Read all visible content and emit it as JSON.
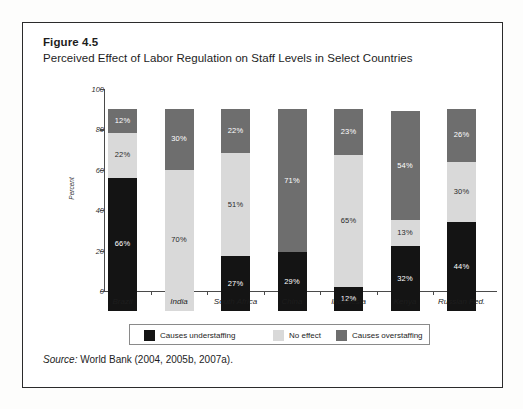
{
  "figure": {
    "number": "Figure 4.5",
    "subtitle": "Perceived Effect of Labor Regulation on Staff Levels in Select Countries",
    "source_prefix": "Source:",
    "source_text": " World Bank (2004, 2005b, 2007a)."
  },
  "colors": {
    "understaffing": "#141414",
    "no_effect": "#d9d9d9",
    "overstaffing": "#6e6e6e",
    "axis": "#4a4a4a",
    "frame": "#2b2b2b",
    "background": "#ffffff"
  },
  "legend": {
    "items": [
      {
        "label": "Causes understaffing",
        "color": "#141414"
      },
      {
        "label": "No effect",
        "color": "#d9d9d9"
      },
      {
        "label": "Causes overstaffing",
        "color": "#6e6e6e"
      }
    ]
  },
  "chart_data": {
    "type": "bar",
    "subtype": "stacked-column-100",
    "title": "Perceived Effect of Labor Regulation on Staff Levels in Select Countries",
    "xlabel": "",
    "ylabel": "Percent",
    "ylim": [
      0,
      100
    ],
    "yticks": [
      0,
      20,
      40,
      60,
      80,
      100
    ],
    "ytick_labels": [
      "0",
      "20",
      "40",
      "60",
      "80",
      "100"
    ],
    "grid": false,
    "legend_position": "bottom",
    "categories": [
      "Brazil",
      "India",
      "South Africa",
      "China",
      "Indonesia",
      "Kenya",
      "Russian Fed."
    ],
    "series": [
      {
        "name": "Causes understaffing",
        "color": "#141414",
        "values": [
          66,
          0,
          27,
          29,
          12,
          32,
          44
        ]
      },
      {
        "name": "No effect",
        "color": "#d9d9d9",
        "values": [
          22,
          70,
          51,
          0,
          65,
          13,
          30
        ]
      },
      {
        "name": "Causes overstaffing",
        "color": "#6e6e6e",
        "values": [
          12,
          30,
          22,
          71,
          23,
          54,
          26
        ]
      }
    ],
    "data_labels": [
      {
        "category": "Brazil",
        "understaffing": "66%",
        "no_effect": "22%",
        "overstaffing": "12%"
      },
      {
        "category": "India",
        "understaffing": "",
        "no_effect": "70%",
        "overstaffing": "30%"
      },
      {
        "category": "South Africa",
        "understaffing": "27%",
        "no_effect": "51%",
        "overstaffing": "22%"
      },
      {
        "category": "China",
        "understaffing": "29%",
        "no_effect": "",
        "overstaffing": "71%"
      },
      {
        "category": "Indonesia",
        "understaffing": "12%",
        "no_effect": "65%",
        "overstaffing": "23%"
      },
      {
        "category": "Kenya",
        "understaffing": "32%",
        "no_effect": "13%",
        "overstaffing": "54%"
      },
      {
        "category": "Russian Fed.",
        "understaffing": "44%",
        "no_effect": "30%",
        "overstaffing": "26%"
      }
    ]
  }
}
